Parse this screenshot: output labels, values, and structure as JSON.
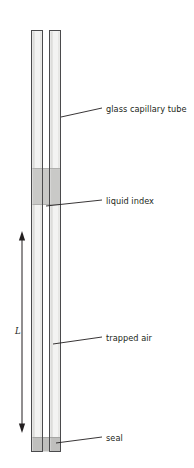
{
  "figure": {
    "background": "#ffffff",
    "stroke_color": "#58595b",
    "outline_dark": "#404042",
    "glass_fill": "#f2f2f1",
    "glass_edge_shade": "#d8d8d6",
    "liquid_fill": "#c7c7c5",
    "seal_fill": "#bdbdbb",
    "leader_color": "#231f20"
  },
  "labels": {
    "glass": "glass capillary tube",
    "liquid": "liquid index",
    "air": "trapped air",
    "seal": "seal",
    "length": "L"
  },
  "geometry": {
    "tube_top": 30,
    "tube_bottom": 452,
    "left_wall_x": 31,
    "left_wall_w": 12,
    "right_wall_x": 49,
    "right_wall_w": 12,
    "liquid_top": 168,
    "liquid_bottom": 205,
    "seal_top": 437,
    "seal_bottom": 452,
    "dimension_top": 232,
    "dimension_bottom": 432,
    "dimension_x": 22
  }
}
